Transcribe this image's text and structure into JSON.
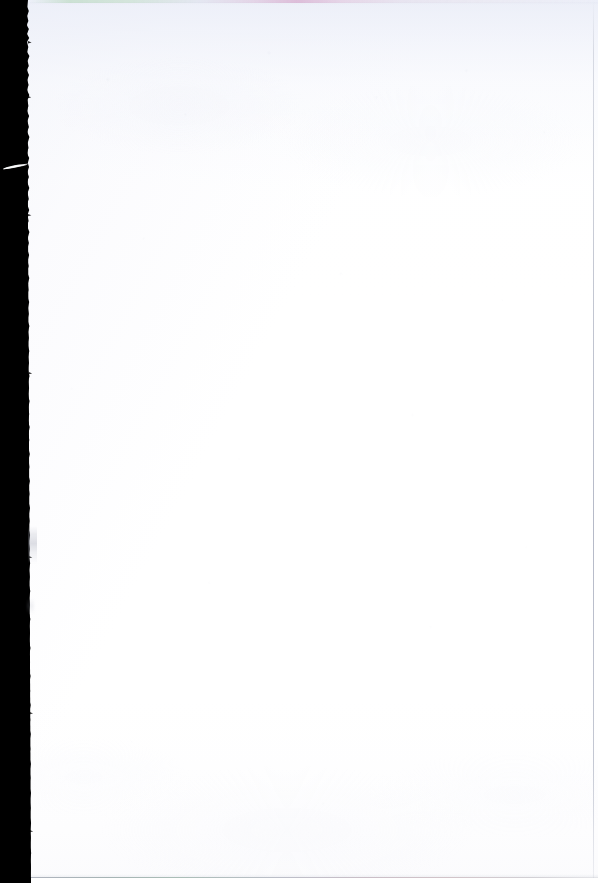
{
  "document": {
    "kind": "scanned-page",
    "description": "Blank scanned book page",
    "page_content_text": "",
    "caption": "Blank scanned page"
  },
  "canvas": {
    "width_px": 598,
    "height_px": 883,
    "background_color": "#ffffff"
  },
  "page": {
    "paper_color": "#ffffff",
    "paper_tint_color": "#f2f3f8",
    "left_edge_x_top_px": 27,
    "left_edge_x_bottom_px": 31,
    "right_edge_x_px": 593,
    "bottom_edge_y_px": 877,
    "text_content": ""
  },
  "artifacts": {
    "gutter_void": {
      "label": "scanner void",
      "color": "#000000",
      "width_top_px": 27,
      "width_bottom_px": 31
    },
    "torn_edge": {
      "label": "ragged page edge"
    },
    "white_streak": {
      "label": "white streak artifact",
      "x_px": 2,
      "y_px": 163,
      "width_px": 27,
      "height_px": 9
    },
    "edge_smudge": {
      "label": "gray fiber smudge",
      "x_px": 28,
      "y_px": 526
    },
    "top_fringe": {
      "label": "chromatic aberration fringe",
      "left_color": "#8cc48c",
      "right_color": "#c46ea8"
    },
    "right_rule": {
      "label": "right edge scan line",
      "color": "#969cb0"
    },
    "bottom_rule": {
      "label": "bottom edge scan line",
      "color": "#969caa"
    }
  }
}
